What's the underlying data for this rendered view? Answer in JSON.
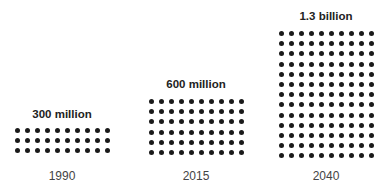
{
  "chart_data": {
    "type": "pictogram",
    "title": "",
    "unit_per_dot": "10 million",
    "categories": [
      "1990",
      "2015",
      "2040"
    ],
    "values": [
      300000000,
      600000000,
      1300000000
    ],
    "value_labels": [
      "300 million",
      "600 million",
      "1.3 billion"
    ],
    "dots": [
      30,
      60,
      130
    ],
    "columns": 10,
    "rows": [
      3,
      6,
      13
    ],
    "dot_color": "#1a1a1a",
    "grid": false,
    "legend": null
  },
  "groups": [
    {
      "year": "1990",
      "label": "300 million"
    },
    {
      "year": "2015",
      "label": "600 million"
    },
    {
      "year": "2040",
      "label": "1.3 billion"
    }
  ]
}
